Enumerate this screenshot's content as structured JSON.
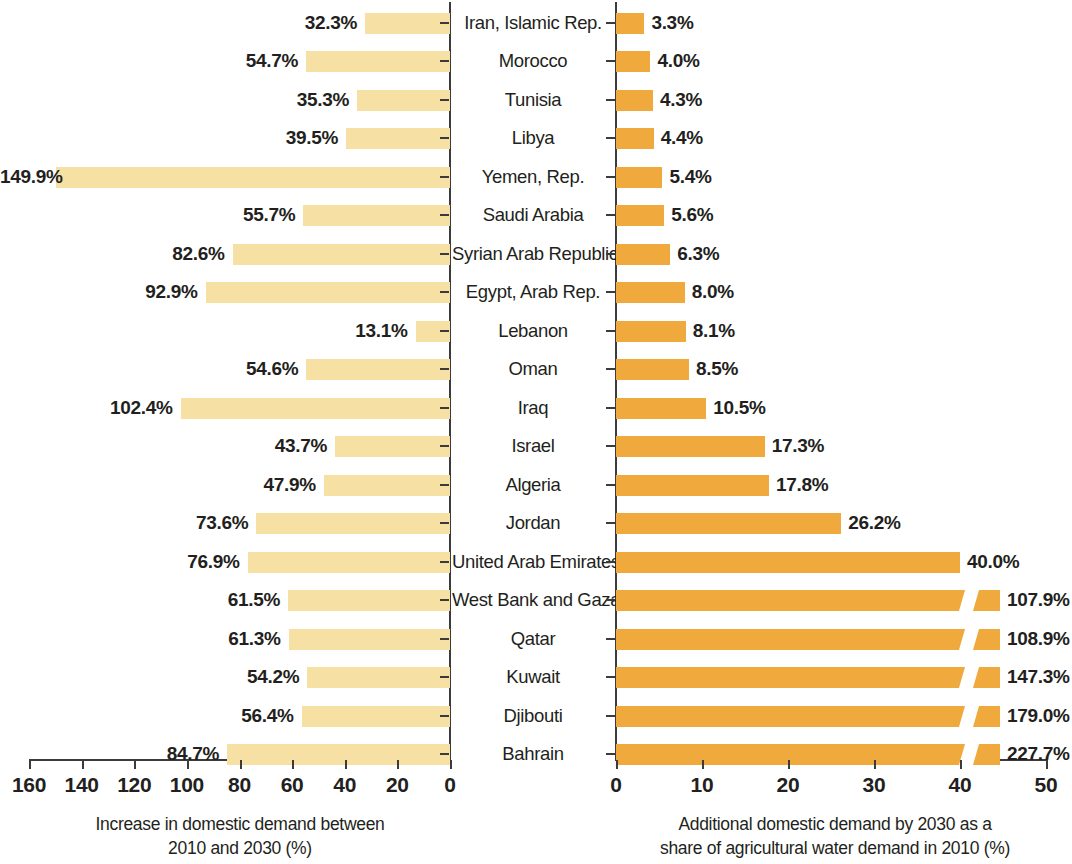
{
  "chart_data": {
    "type": "bar",
    "title": "",
    "orientation": "horizontal",
    "layout": "back-to-back paired horizontal bar chart (pyramid)",
    "categories": [
      "Iran, Islamic Rep.",
      "Morocco",
      "Tunisia",
      "Libya",
      "Yemen, Rep.",
      "Saudi Arabia",
      "Syrian Arab Republic",
      "Egypt, Arab Rep.",
      "Lebanon",
      "Oman",
      "Iraq",
      "Israel",
      "Algeria",
      "Jordan",
      "United Arab Emirates",
      "West Bank and Gaza",
      "Qatar",
      "Kuwait",
      "Djibouti",
      "Bahrain"
    ],
    "series": [
      {
        "name": "Increase in domestic demand between 2010 and 2030 (%)",
        "side": "left",
        "color": "#f6e0a4",
        "axis_direction": "reversed",
        "xlim": [
          0,
          160
        ],
        "ticks": [
          160,
          140,
          120,
          100,
          80,
          60,
          40,
          20,
          0
        ],
        "xlabel_lines": [
          "Increase in domestic demand between",
          "2010 and 2030 (%)"
        ],
        "values": [
          32.3,
          54.7,
          35.3,
          39.5,
          149.9,
          55.7,
          82.6,
          92.9,
          13.1,
          54.6,
          102.4,
          43.7,
          47.9,
          73.6,
          76.9,
          61.5,
          61.3,
          54.2,
          56.4,
          84.7
        ],
        "labels": [
          "32.3%",
          "54.7%",
          "35.3%",
          "39.5%",
          "149.9%",
          "55.7%",
          "82.6%",
          "92.9%",
          "13.1%",
          "54.6%",
          "102.4%",
          "43.7%",
          "47.9%",
          "73.6%",
          "76.9%",
          "61.5%",
          "61.3%",
          "54.2%",
          "56.4%",
          "84.7%"
        ]
      },
      {
        "name": "Additional domestic demand by 2030 as a share of agricultural water demand in 2010 (%)",
        "side": "right",
        "color": "#efa93c",
        "axis_direction": "normal",
        "xlim": [
          0,
          50
        ],
        "ticks": [
          0,
          10,
          20,
          30,
          40,
          50
        ],
        "xlabel_lines": [
          "Additional domestic demand by 2030 as a",
          "share of agricultural water demand in 2010 (%)"
        ],
        "values": [
          3.3,
          4.0,
          4.3,
          4.4,
          5.4,
          5.6,
          6.3,
          8.0,
          8.1,
          8.5,
          10.5,
          17.3,
          17.8,
          26.2,
          40.0,
          107.9,
          108.9,
          147.3,
          179.0,
          227.7
        ],
        "labels": [
          "3.3%",
          "4.0%",
          "4.3%",
          "4.4%",
          "5.4%",
          "5.6%",
          "6.3%",
          "8.0%",
          "8.1%",
          "8.5%",
          "10.5%",
          "17.3%",
          "17.8%",
          "26.2%",
          "40.0%",
          "107.9%",
          "108.9%",
          "147.3%",
          "179.0%",
          "227.7%"
        ],
        "broken_axis_rows": [
          15,
          16,
          17,
          18,
          19
        ],
        "broken_axis_note": "bars exceeding 50% are truncated with a diagonal break mark near 40"
      }
    ],
    "grid": false,
    "legend": "none"
  },
  "colors": {
    "left_bar": "#f6e0a4",
    "right_bar": "#efa93c",
    "axis": "#3b3b3b",
    "text": "#231f20",
    "background": "#ffffff"
  }
}
